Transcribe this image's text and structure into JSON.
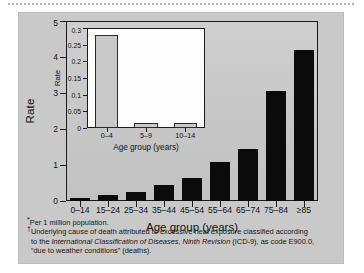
{
  "chart_data": {
    "type": "bar",
    "title": "",
    "xlabel": "Age group (years)",
    "ylabel": "Rate",
    "categories": [
      "0–14",
      "15–24",
      "25–34",
      "35–44",
      "45–54",
      "55–64",
      "65–74",
      "75–84",
      "≥85"
    ],
    "values": [
      0.08,
      0.18,
      0.26,
      0.45,
      0.63,
      1.07,
      1.44,
      3.05,
      4.2
    ],
    "ylim": [
      0,
      5
    ],
    "yticks": [
      "0",
      "1",
      "2",
      "3",
      "4",
      "5"
    ],
    "ytick_values": [
      0,
      1,
      2,
      3,
      4,
      5
    ],
    "grid": false,
    "legend": null,
    "bar_color": "#0b0b0b",
    "inset": {
      "type": "bar",
      "xlabel": "Age group (years)",
      "ylabel": "Rate",
      "categories": [
        "0–4",
        "5–9",
        "10–14"
      ],
      "values": [
        0.28,
        0.015,
        0.015
      ],
      "ylim": [
        0,
        0.3
      ],
      "yticks": [
        "0",
        "0.05",
        "0.1",
        "0.15",
        "0.2",
        "0.25",
        "0.3"
      ],
      "ytick_values": [
        0,
        0.05,
        0.1,
        0.15,
        0.2,
        0.25,
        0.3
      ],
      "grid": false,
      "bar_color": "#c9c9c9"
    }
  },
  "footnotes": {
    "line1_marker": "*",
    "line1": "Per 1 million population.",
    "line2_marker": "†",
    "line2_a": "Underlying cause of death attributed to excessive heat exposure classified according",
    "line3_a": "to the ",
    "line3_italic": "International Classification of Diseases, Ninth Revision",
    "line3_b": " (ICD-9), as code E900.0,",
    "line4": "“due to weather conditions” (deaths)."
  },
  "colors": {
    "panel_background": "#c9c9c9",
    "axis": "#1a1a1a",
    "inset_background": "#fdfdfd",
    "main_bar": "#0b0b0b",
    "inset_bar": "#c9c9c9"
  }
}
